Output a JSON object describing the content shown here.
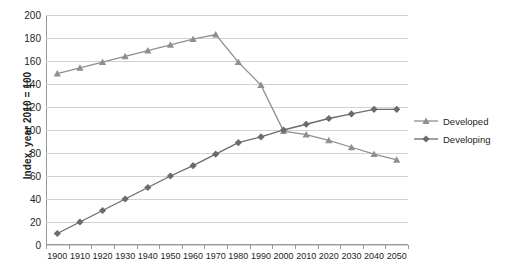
{
  "chart_data": {
    "type": "line",
    "title": "",
    "xlabel": "",
    "ylabel": "Index, year 2010 = 100",
    "xlim": [
      1900,
      2060
    ],
    "ylim": [
      0,
      200
    ],
    "ytick_step": 20,
    "grid": true,
    "legend_position": "right",
    "x": [
      1905,
      1915,
      1925,
      1935,
      1945,
      1955,
      1965,
      1975,
      1985,
      1995,
      2005,
      2015,
      2025,
      2035,
      2045,
      2055
    ],
    "xticks": [
      1900,
      1910,
      1920,
      1930,
      1940,
      1950,
      1960,
      1970,
      1980,
      1990,
      2000,
      2010,
      2020,
      2030,
      2040,
      2050
    ],
    "yticks": [
      0,
      20,
      40,
      60,
      80,
      100,
      120,
      140,
      160,
      180,
      200
    ],
    "series": [
      {
        "name": "Developed",
        "marker": "triangle",
        "color": "#8f8f8f",
        "values": [
          149,
          154,
          159,
          164,
          169,
          174,
          179,
          183,
          159,
          139,
          99,
          96,
          91,
          85,
          79,
          74
        ]
      },
      {
        "name": "Developing",
        "marker": "diamond",
        "color": "#6b6b6b",
        "values": [
          10,
          20,
          30,
          40,
          50,
          60,
          69,
          79,
          89,
          94,
          100,
          105,
          110,
          114,
          118,
          118
        ]
      }
    ]
  },
  "legend": {
    "items": [
      {
        "label": "Developed"
      },
      {
        "label": "Developing"
      }
    ]
  },
  "axes": {
    "y_title": "Index, year 2010 = 100"
  }
}
